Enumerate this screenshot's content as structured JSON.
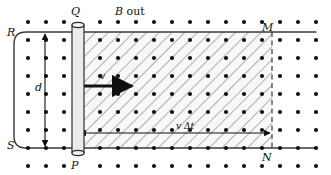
{
  "figure": {
    "background_color": "#ffffff",
    "ink_color": "#1a1a1a",
    "rod_fill_color": "#e8e8e8",
    "hatch_color": "#555555",
    "region_fill_color": "#f7f7f7"
  },
  "labels": {
    "field_prefix": "B",
    "field_suffix": " out",
    "rod_top": "Q",
    "rod_bottom": "P",
    "rail_top_left": "R",
    "rail_bottom_left": "S",
    "corner_top_right": "M",
    "corner_bottom_right": "N",
    "separation": "d",
    "velocity": "v",
    "displacement": "v Δt"
  },
  "geometry": {
    "rod_x": 72,
    "rod_width": 12,
    "rail_top_y": 32,
    "rail_bottom_y": 148,
    "dashed_edge_x": 272,
    "rail_right_x": 316,
    "rail_left_curve_x": 14,
    "dot_spacing_x": 18,
    "dot_spacing_y": 18,
    "dot_radius": 2.1,
    "dot_first_x": 28,
    "dot_first_y": 22,
    "dot_columns": 17,
    "dot_rows": 9
  },
  "field": {
    "direction": "out-of-page",
    "marker": "dot"
  },
  "arrows": {
    "velocity_arrow": {
      "x1": 79,
      "y1": 86,
      "x2": 136,
      "y2": 86,
      "style": "thick-solid"
    },
    "displacement_arrow": {
      "x1": 79,
      "y1": 133,
      "x2": 271,
      "y2": 133,
      "style": "double-headed"
    },
    "separation_arrow": {
      "x": 45,
      "y1": 33,
      "y2": 147,
      "style": "double-headed-vertical"
    }
  }
}
